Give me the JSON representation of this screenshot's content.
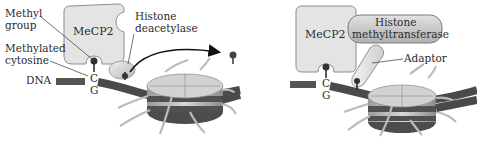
{
  "panels": [
    {
      "id": "left",
      "labels": {
        "methyl_group_line1": "Methyl",
        "methyl_group_line2": "group",
        "methylated_cytosine_line1": "Methylated",
        "methylated_cytosine_line2": "cytosine",
        "dna": "DNA",
        "mecp2": "MeCP2",
        "histone_deacetylase_line1": "Histone",
        "histone_deacetylase_line2": "deacetylase",
        "base_c": "C",
        "base_g": "G"
      }
    },
    {
      "id": "right",
      "labels": {
        "mecp2": "MeCP2",
        "histone_methyltransferase_line1": "Histone",
        "histone_methyltransferase_line2": "methyltransferase",
        "adaptor": "Adaptor",
        "base_c": "C",
        "base_g": "G"
      }
    }
  ],
  "colors": {
    "protein_fill": "#e6e6e6",
    "protein_stroke": "#8a8a8a",
    "dna": "#4a4a4a",
    "methyl": "#333333",
    "histone_top": "#d4d4d4",
    "histone_band": "#555555",
    "tail": "#bdbdbd"
  }
}
